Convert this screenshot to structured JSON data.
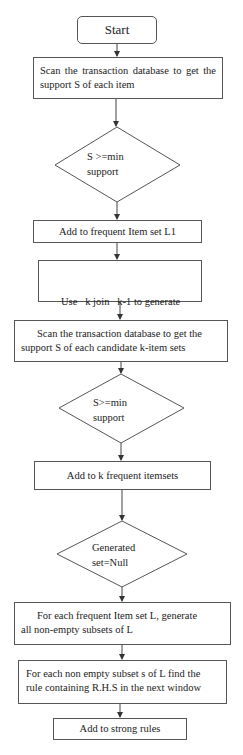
{
  "flowchart": {
    "start": {
      "label": "Start"
    },
    "steps": {
      "scan_items": {
        "label": "Scan the transaction database to get the support S of each item"
      },
      "decision_1": {
        "line1": "S >=min",
        "line2": "support"
      },
      "add_l1": {
        "label": "Add to frequent Item set L1"
      },
      "join": {
        "line1": "Use   k join   k-1 to generate",
        "line2": "a set of candidate k-item set"
      },
      "scan_candidates": {
        "line1": "Scan the transaction database to get the",
        "line2": "support S of each candidate k-item sets"
      },
      "decision_2": {
        "line1": "S>=min",
        "line2": "support"
      },
      "add_k": {
        "label": "Add to k frequent itemsets"
      },
      "decision_3": {
        "line1": "Generated",
        "line2": "set=Null"
      },
      "subsets": {
        "line1": "For each frequent Item set L, generate",
        "line2": "all non-empty subsets of L"
      },
      "find_rule": {
        "line1": "For each non empty subset s of L find the",
        "line2": "rule containing R.H.S in the next window"
      },
      "add_strong": {
        "label": "Add to strong rules"
      }
    },
    "colors": {
      "stroke": "#555555",
      "text": "#222222",
      "background": "#ffffff"
    }
  }
}
